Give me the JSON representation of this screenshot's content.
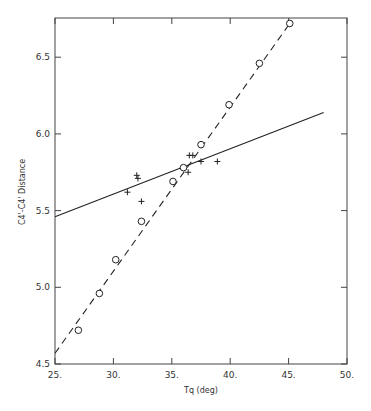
{
  "chart_data": {
    "type": "scatter",
    "title": "",
    "xlabel": "Tq (deg)",
    "ylabel": "C4'-C4' Distance",
    "xlim": [
      25,
      50
    ],
    "ylim": [
      4.5,
      6.75
    ],
    "x_ticks": [
      "25.",
      "30.",
      "35.",
      "40.",
      "45.",
      "50."
    ],
    "y_ticks": [
      "4.5",
      "5.0",
      "5.5",
      "6.0",
      "6.5"
    ],
    "grid": false,
    "legend": null,
    "series": [
      {
        "name": "circles",
        "marker": "o",
        "points": [
          [
            27.0,
            4.72
          ],
          [
            28.8,
            4.96
          ],
          [
            30.2,
            5.18
          ],
          [
            32.4,
            5.43
          ],
          [
            35.1,
            5.69
          ],
          [
            36.0,
            5.78
          ],
          [
            37.5,
            5.93
          ],
          [
            39.9,
            6.19
          ],
          [
            42.5,
            6.46
          ],
          [
            45.1,
            6.72
          ]
        ],
        "fit_line": {
          "style": "dashed",
          "from": [
            25.0,
            4.57
          ],
          "to": [
            45.1,
            6.72
          ]
        }
      },
      {
        "name": "crosses",
        "marker": "+",
        "points": [
          [
            31.2,
            5.62
          ],
          [
            32.0,
            5.73
          ],
          [
            32.1,
            5.71
          ],
          [
            32.4,
            5.56
          ],
          [
            36.4,
            5.75
          ],
          [
            36.5,
            5.86
          ],
          [
            36.8,
            5.86
          ],
          [
            37.5,
            5.82
          ],
          [
            38.9,
            5.82
          ]
        ],
        "fit_line": {
          "style": "solid",
          "from": [
            25.0,
            5.46
          ],
          "to": [
            48.0,
            6.14
          ]
        }
      }
    ]
  }
}
